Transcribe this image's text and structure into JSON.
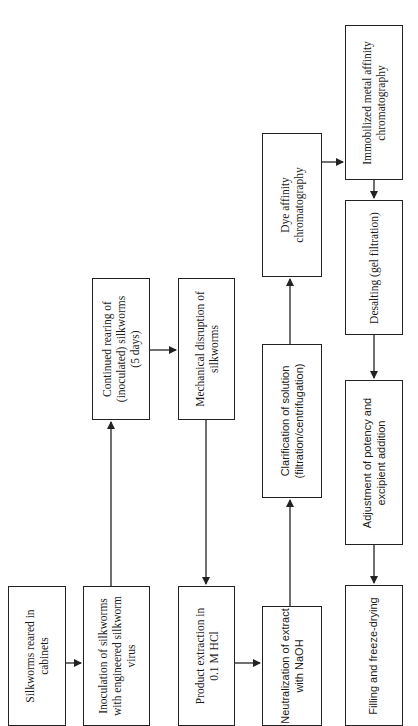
{
  "diagram": {
    "title": "",
    "orientation": "rotated-90-ccw",
    "steps": [
      {
        "id": "s1",
        "label": "Silkworms reared in\ncabinets"
      },
      {
        "id": "s2",
        "label": "Inoculation of silkworms\nwith engineered silkworm\nvirus"
      },
      {
        "id": "s3",
        "label": "Continued rearing of\n(inoculated) silkworms\n(5 days)"
      },
      {
        "id": "s4",
        "label": "Mechanical disruption of\nsilkworms"
      },
      {
        "id": "s5",
        "label": "Product extraction in\n0.1 M HCl"
      },
      {
        "id": "s6",
        "label": "Neutralization of extract\nwith NaOH"
      },
      {
        "id": "s7",
        "label": "Clarification of solution\n(filtration/centrifugation)"
      },
      {
        "id": "s8",
        "label": "Dye affinity\nchromatography"
      },
      {
        "id": "s9",
        "label": "Immobilized metal affinity\nchromatography"
      },
      {
        "id": "s10",
        "label": "Desalting (gel filtration)"
      },
      {
        "id": "s11",
        "label": "Adjustment of potency and\nexcipient addition"
      },
      {
        "id": "s12",
        "label": "Filling and freeze-drying"
      }
    ],
    "flow": [
      [
        "s1",
        "s2"
      ],
      [
        "s2",
        "s3"
      ],
      [
        "s3",
        "s4"
      ],
      [
        "s4",
        "s5"
      ],
      [
        "s5",
        "s6"
      ],
      [
        "s6",
        "s7"
      ],
      [
        "s7",
        "s8"
      ],
      [
        "s8",
        "s9"
      ],
      [
        "s9",
        "s10"
      ],
      [
        "s10",
        "s11"
      ],
      [
        "s11",
        "s12"
      ]
    ],
    "colors": {
      "line": "#222222",
      "background": "#ffffff",
      "text": "#1a1a1a"
    }
  }
}
